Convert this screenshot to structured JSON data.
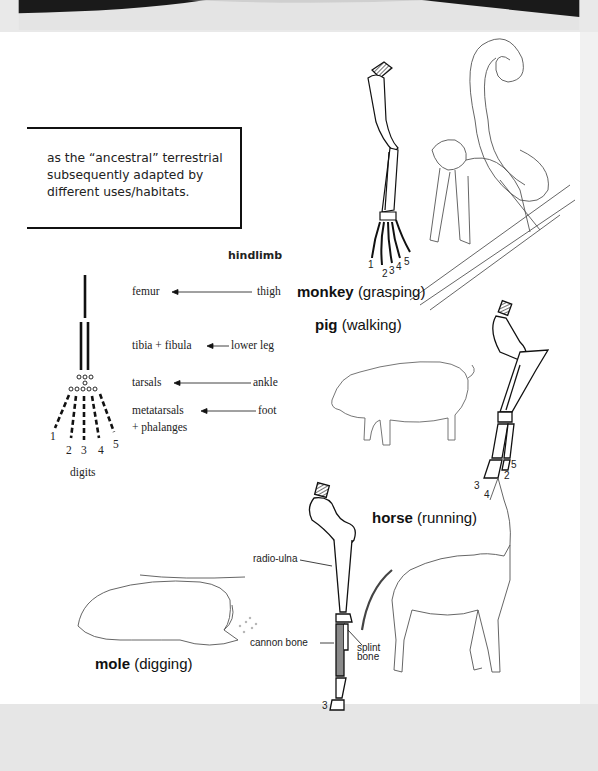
{
  "note": {
    "text_line1": "as the “ancestral” terrestrial",
    "text_line2": "subsequently adapted by",
    "text_line3": "different uses/habitats."
  },
  "hindlimb_diagram": {
    "title": "hindlimb",
    "rows": [
      {
        "bone": "femur",
        "region": "thigh"
      },
      {
        "bone": "tibia + fibula",
        "region": "lower leg"
      },
      {
        "bone": "tarsals",
        "region": "ankle"
      },
      {
        "bone": "metatarsals",
        "region": "foot"
      }
    ],
    "phalanges": "+ phalanges",
    "digits": [
      "1",
      "2",
      "3",
      "4",
      "5"
    ],
    "digits_label": "digits"
  },
  "animals": {
    "monkey": {
      "name": "monkey",
      "use": "(grasping)",
      "digits": [
        "1",
        "2",
        "3",
        "4",
        "5"
      ]
    },
    "pig": {
      "name": "pig",
      "use": "(walking)",
      "digits": [
        "3",
        "4",
        "2",
        "5"
      ]
    },
    "horse": {
      "name": "horse",
      "use": "(running)",
      "digit": "3",
      "labels": {
        "radio_ulna": "radio-ulna",
        "cannon_bone": "cannon bone",
        "splint_bone_1": "splint",
        "splint_bone_2": "bone"
      }
    },
    "mole": {
      "name": "mole",
      "use": "(digging)"
    }
  },
  "colors": {
    "slide_bg": "#ffffff",
    "page_bg": "#e9e9e9",
    "ink": "#111111",
    "cannon_fill": "#8a8a8a"
  }
}
